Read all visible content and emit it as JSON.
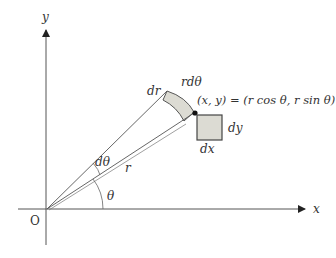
{
  "diagram": {
    "axes": {
      "x_label": "x",
      "y_label": "y",
      "origin_label": "O"
    },
    "labels": {
      "dr": "dr",
      "r_dtheta": "rdθ",
      "point": "(x, y) = (r cos θ, r sin θ)",
      "dy": "dy",
      "dx": "dx",
      "dtheta": "dθ",
      "r": "r",
      "theta": "θ"
    },
    "colors": {
      "line": "#444444",
      "fill": "#dcdbd3",
      "background": "#ffffff",
      "point": "#111111"
    }
  }
}
